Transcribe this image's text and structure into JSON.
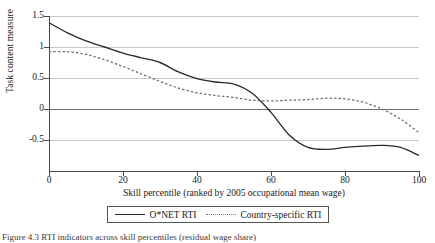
{
  "figure": {
    "caption": "Figure 4.3  RTI indicators across skill percentiles (residual wage share)"
  },
  "legend": {
    "entries": [
      {
        "label": "O*NET RTI",
        "style": "solid",
        "color": "#2b2b2b"
      },
      {
        "label": "Country-specific RTI",
        "style": "dotted",
        "color": "#6a6a6a"
      }
    ]
  },
  "chart_data": {
    "type": "line",
    "title": "",
    "xlabel": "Skill percentile (ranked by 2005 occupational mean wage)",
    "ylabel": "Task content measure",
    "xlim": [
      0,
      100
    ],
    "ylim": [
      -0.75,
      1.55
    ],
    "xticks": [
      0,
      20,
      40,
      60,
      80,
      100
    ],
    "yticks": [
      1.5,
      1,
      0.5,
      0,
      -0.5
    ],
    "ytick_labels": [
      "1.5",
      "1",
      "0.5",
      "0",
      "-0.5"
    ],
    "grid": true,
    "zero_line": 0,
    "legend_position": "below-plot",
    "x": [
      0,
      5,
      10,
      15,
      20,
      25,
      30,
      35,
      40,
      45,
      50,
      55,
      60,
      65,
      70,
      75,
      80,
      85,
      90,
      95,
      100
    ],
    "series": [
      {
        "name": "O*NET RTI",
        "style": "solid",
        "color": "#2b2b2b",
        "values": [
          1.45,
          1.3,
          1.18,
          1.09,
          1.0,
          0.93,
          0.86,
          0.72,
          0.62,
          0.57,
          0.54,
          0.47,
          0.35,
          0.22,
          0.08,
          -0.04,
          -0.12,
          -0.18,
          -0.2,
          -0.2,
          -0.21
        ]
      },
      {
        "name": "Country-specific RTI",
        "style": "dotted",
        "color": "#6a6a6a",
        "values": [
          1.02,
          1.02,
          0.98,
          0.9,
          0.8,
          0.69,
          0.58,
          0.48,
          0.41,
          0.37,
          0.34,
          0.3,
          0.29,
          0.3,
          0.31,
          0.33,
          0.32,
          0.27,
          0.17,
          0.02,
          -0.18
        ]
      }
    ],
    "series_onet_detail": {
      "note": "O*NET RTI continues below zero to the right",
      "x": [
        0,
        5,
        10,
        15,
        20,
        25,
        30,
        35,
        40,
        45,
        50,
        55,
        60,
        65,
        70,
        75,
        80,
        85,
        90,
        95,
        100
      ],
      "values": [
        1.45,
        1.3,
        1.18,
        1.09,
        1.0,
        0.93,
        0.86,
        0.72,
        0.62,
        0.57,
        0.54,
        0.4,
        0.12,
        -0.22,
        -0.4,
        -0.43,
        -0.4,
        -0.38,
        -0.37,
        -0.4,
        -0.52
      ]
    }
  }
}
